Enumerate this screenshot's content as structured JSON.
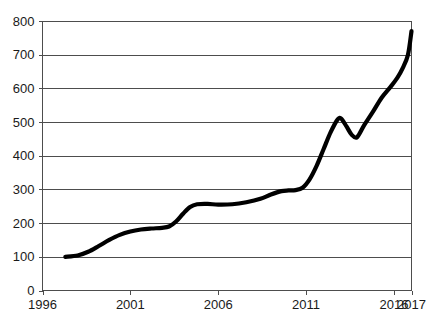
{
  "chart_data": {
    "type": "line",
    "title": "",
    "subtitle": "",
    "xlabel": "",
    "ylabel": "",
    "xlim": [
      1996,
      2017
    ],
    "ylim": [
      0,
      800
    ],
    "grid": true,
    "legend": null,
    "legend_position": "none",
    "line_color": "#000000",
    "grid_color": "#4d4d4d",
    "axis_color": "#4d4d4d",
    "background_color": "#ffffff",
    "y_ticks": [
      0,
      100,
      200,
      300,
      400,
      500,
      600,
      700,
      800
    ],
    "y_tick_labels": [
      "0",
      "100",
      "200",
      "300",
      "400",
      "500",
      "600",
      "700",
      "800"
    ],
    "x_ticks": [
      1996,
      2001,
      2006,
      2011,
      2016,
      2017
    ],
    "x_tick_labels": [
      "1996",
      "2001",
      "2006",
      "2011",
      "2016",
      "2017"
    ],
    "series": [
      {
        "name": "value",
        "x": [
          1997.3,
          1998.0,
          1998.6,
          1999.2,
          1999.8,
          2000.4,
          2001.0,
          2001.6,
          2002.2,
          2002.8,
          2003.2,
          2003.6,
          2004.0,
          2004.4,
          2004.8,
          2005.4,
          2006.0,
          2006.8,
          2007.6,
          2008.4,
          2009.0,
          2009.6,
          2010.0,
          2010.4,
          2010.8,
          2011.2,
          2011.6,
          2012.0,
          2012.4,
          2012.8,
          2013.0,
          2013.3,
          2013.6,
          2013.9,
          2014.3,
          2014.8,
          2015.3,
          2015.8,
          2016.2,
          2016.5,
          2016.8,
          2017.0
        ],
        "y": [
          100,
          104,
          115,
          132,
          150,
          165,
          175,
          181,
          184,
          186,
          190,
          205,
          228,
          248,
          256,
          257,
          255,
          256,
          262,
          272,
          285,
          295,
          297,
          298,
          305,
          330,
          370,
          420,
          470,
          508,
          510,
          487,
          462,
          455,
          490,
          530,
          572,
          604,
          632,
          660,
          700,
          770
        ]
      }
    ],
    "annotations": []
  }
}
